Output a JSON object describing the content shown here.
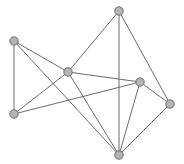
{
  "figure": {
    "kind": "undirected-graph-drawing",
    "width": 184,
    "height": 164,
    "background_color": "#ffffff",
    "node_count": 7,
    "edge_count": 13
  },
  "style": {
    "node_fill": "#b4b4b4",
    "node_stroke": "#6e6e6e",
    "node_radius": 4.2,
    "node_stroke_width": 1,
    "edge_color": "#6b6b6b",
    "edge_width": 1
  },
  "chart_data": {
    "type": "scatter",
    "title": "",
    "xlabel": "",
    "ylabel": "",
    "xlim": [
      0,
      184
    ],
    "ylim": [
      0,
      164
    ],
    "grid": false,
    "legend": "none",
    "nodes": [
      {
        "id": "A",
        "x": 14,
        "y": 41,
        "degree": 3
      },
      {
        "id": "B",
        "x": 119,
        "y": 11,
        "degree": 3
      },
      {
        "id": "C",
        "x": 68,
        "y": 72,
        "degree": 5
      },
      {
        "id": "D",
        "x": 140,
        "y": 82,
        "degree": 5
      },
      {
        "id": "E",
        "x": 170,
        "y": 104,
        "degree": 3
      },
      {
        "id": "F",
        "x": 14,
        "y": 114,
        "degree": 3
      },
      {
        "id": "G",
        "x": 119,
        "y": 155,
        "degree": 5
      }
    ],
    "edges": [
      {
        "source": "A",
        "target": "C"
      },
      {
        "source": "A",
        "target": "F"
      },
      {
        "source": "A",
        "target": "G"
      },
      {
        "source": "B",
        "target": "C"
      },
      {
        "source": "B",
        "target": "E"
      },
      {
        "source": "B",
        "target": "G"
      },
      {
        "source": "C",
        "target": "D"
      },
      {
        "source": "C",
        "target": "F"
      },
      {
        "source": "C",
        "target": "G"
      },
      {
        "source": "D",
        "target": "E"
      },
      {
        "source": "D",
        "target": "F"
      },
      {
        "source": "D",
        "target": "G"
      },
      {
        "source": "E",
        "target": "G"
      }
    ]
  }
}
